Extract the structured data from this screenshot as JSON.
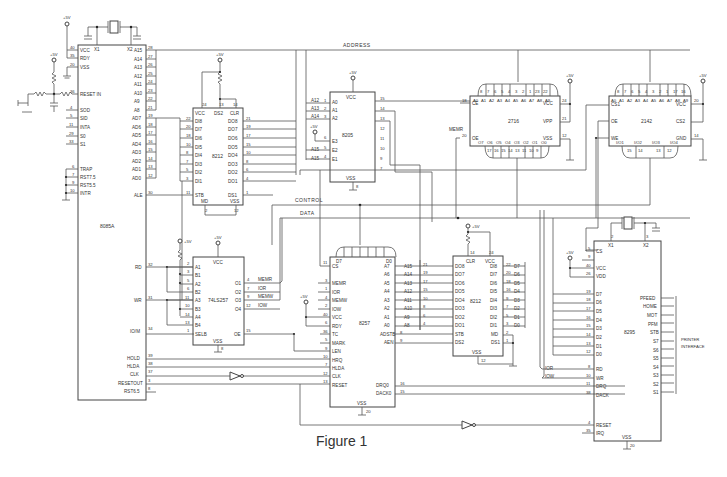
{
  "figure": {
    "caption": "Figure 1",
    "supply_label": "+5V",
    "buses": {
      "address": "ADDRESS",
      "control": "CONTROL",
      "data": "DATA"
    },
    "chips": {
      "cpu": {
        "name": "8085A",
        "left_pins": [
          {
            "num": "40",
            "label": "VCC"
          },
          {
            "num": "35",
            "label": "RDY"
          },
          {
            "num": "20",
            "label": "VSS"
          },
          {
            "num": "36",
            "label": "RESET IN"
          },
          {
            "num": "4",
            "label": "SOD"
          },
          {
            "num": "5",
            "label": "SID"
          },
          {
            "num": "11",
            "label": "INTA"
          },
          {
            "num": "29",
            "label": "S0"
          },
          {
            "num": "33",
            "label": "S1"
          },
          {
            "num": "6",
            "label": "TRAP"
          },
          {
            "num": "7",
            "label": "RST7.5"
          },
          {
            "num": "9",
            "label": "RST5.5"
          },
          {
            "num": "10",
            "label": "INTR"
          }
        ],
        "top_pins": [
          {
            "num": "1",
            "label": "X1"
          },
          {
            "num": "2",
            "label": "X2"
          }
        ],
        "right_pins": [
          {
            "num": "28",
            "label": "A15"
          },
          {
            "num": "27",
            "label": "A14"
          },
          {
            "num": "26",
            "label": "A13"
          },
          {
            "num": "25",
            "label": "A12"
          },
          {
            "num": "24",
            "label": "A11"
          },
          {
            "num": "23",
            "label": "A10"
          },
          {
            "num": "22",
            "label": "A9"
          },
          {
            "num": "21",
            "label": "A8"
          },
          {
            "num": "19",
            "label": "AD7"
          },
          {
            "num": "18",
            "label": "AD6"
          },
          {
            "num": "17",
            "label": "AD5"
          },
          {
            "num": "16",
            "label": "AD4"
          },
          {
            "num": "15",
            "label": "AD3"
          },
          {
            "num": "14",
            "label": "AD2"
          },
          {
            "num": "13",
            "label": "AD1"
          },
          {
            "num": "12",
            "label": "AD0"
          },
          {
            "num": "30",
            "label": "ALE"
          }
        ],
        "lower_pins": [
          {
            "num": "32",
            "label": "RD"
          },
          {
            "num": "31",
            "label": "WR"
          },
          {
            "num": "34",
            "label": "IO/M"
          },
          {
            "num": "39",
            "label": "HOLD"
          },
          {
            "num": "38",
            "label": "HLDA"
          },
          {
            "num": "37",
            "label": "CLK"
          },
          {
            "num": "3",
            "label": "RESETOUT"
          },
          {
            "num": "8",
            "label": "RST6.5"
          }
        ]
      },
      "latch": {
        "name": "8212",
        "top_pins": [
          {
            "num": "24",
            "label": "VCC"
          },
          {
            "num": "13",
            "label": "DS2"
          },
          {
            "num": "14",
            "label": "CLR"
          }
        ],
        "left_pins": [
          {
            "num": "22",
            "label": "DI8"
          },
          {
            "num": "20",
            "label": "DI7"
          },
          {
            "num": "18",
            "label": "DI6"
          },
          {
            "num": "10",
            "label": "DI5"
          },
          {
            "num": "8",
            "label": "DI4"
          },
          {
            "num": "7",
            "label": "DI3"
          },
          {
            "num": "5",
            "label": "DI2"
          },
          {
            "num": "3",
            "label": "DI1"
          },
          {
            "num": "11",
            "label": "STB"
          }
        ],
        "right_pins": [
          {
            "num": "21",
            "label": "DO8"
          },
          {
            "num": "19",
            "label": "DO7"
          },
          {
            "num": "17",
            "label": "DO6"
          },
          {
            "num": "15",
            "label": "DO5"
          },
          {
            "num": "10",
            "label": "DO4"
          },
          {
            "num": "8",
            "label": "DO3"
          },
          {
            "num": "6",
            "label": "DO2"
          },
          {
            "num": "4",
            "label": "DO1"
          },
          {
            "num": "1",
            "label": "DS1"
          }
        ],
        "bottom_pins": [
          {
            "num": "2",
            "label": "MD"
          },
          {
            "num": "12",
            "label": "VSS"
          }
        ]
      },
      "decoder": {
        "name": "8205",
        "top_pin": "VCC",
        "bottom_pin": "VSS",
        "inputs": [
          {
            "net": "A12",
            "num": "1",
            "label": "A0"
          },
          {
            "net": "A13",
            "num": "2",
            "label": "A1"
          },
          {
            "net": "A14",
            "num": "3",
            "label": "A2"
          },
          {
            "net": "+5V",
            "num": "6",
            "label": "E3"
          },
          {
            "net": "A15",
            "num": "5",
            "label": "E2"
          },
          {
            "net": "A15",
            "num": "4",
            "label": "E1"
          }
        ],
        "outputs": [
          "15",
          "14",
          "13",
          "12",
          "11",
          "10",
          "9",
          "7"
        ],
        "bottom_num": "8"
      },
      "eprom": {
        "name": "2716",
        "addr_pins": [
          "A0",
          "A1",
          "A2",
          "A3",
          "A4",
          "A5",
          "A6",
          "A7",
          "A8",
          "A9"
        ],
        "addr_nums": [
          "8",
          "7",
          "6",
          "5",
          "4",
          "3",
          "2",
          "1",
          "23",
          "22"
        ],
        "data_pins": [
          "O7",
          "O6",
          "O5",
          "O4",
          "O3",
          "O2",
          "O1",
          "O0"
        ],
        "data_nums": [
          "17",
          "16",
          "15",
          "14",
          "13",
          "11",
          "10",
          "9"
        ],
        "left_pins": [
          {
            "num": "18",
            "label": "CE"
          },
          {
            "num": "20",
            "label": "OE"
          }
        ],
        "right_pins": [
          {
            "num": "24",
            "label": "VCC"
          },
          {
            "num": "21",
            "label": "VPP"
          },
          {
            "num": "12",
            "label": "VSS"
          }
        ],
        "oe_net": "MEMR"
      },
      "ram": {
        "name": "2142",
        "addr_pins": [
          "A0",
          "A1",
          "A2",
          "A3",
          "A4",
          "A5",
          "A6",
          "A7",
          "A8",
          "A9"
        ],
        "addr_nums": [
          "8",
          "7",
          "6",
          "5",
          "4",
          "3",
          "2",
          "1",
          "17",
          "16"
        ],
        "data_pins": [
          "I/O1",
          "I/O2",
          "I/O3",
          "I/O4"
        ],
        "data_nums": [
          "15",
          "14",
          "13",
          "12"
        ],
        "left_pins": [
          {
            "num": "",
            "label": "CS1"
          },
          {
            "num": "",
            "label": "OE"
          },
          {
            "num": "",
            "label": "WE"
          }
        ],
        "right_pins": [
          {
            "num": "20",
            "label": "VCC"
          },
          {
            "num": "",
            "label": "CS2"
          },
          {
            "num": "14",
            "label": "GND"
          }
        ]
      },
      "mux": {
        "name": "74LS257",
        "top_pin": "VCC",
        "bottom_pin": "VSS",
        "bottom_num": "8",
        "inputs": [
          {
            "num": "2",
            "label": "A1"
          },
          {
            "num": "3",
            "label": "B1"
          },
          {
            "num": "5",
            "label": "A2"
          },
          {
            "num": "6",
            "label": "B2"
          },
          {
            "num": "11",
            "label": "A3"
          },
          {
            "num": "10",
            "label": "B3"
          },
          {
            "num": "14",
            "label": "A4"
          },
          {
            "num": "13",
            "label": "B4"
          },
          {
            "num": "1",
            "label": "SELB"
          }
        ],
        "outputs": [
          {
            "num": "4",
            "label": "O1",
            "net": "MEMR"
          },
          {
            "num": "7",
            "label": "O2",
            "net": "IOR"
          },
          {
            "num": "9",
            "label": "O3",
            "net": "MEMW"
          },
          {
            "num": "12",
            "label": "O4",
            "net": "IOW"
          },
          {
            "num": "15",
            "label": "OE",
            "net": ""
          }
        ]
      },
      "dma": {
        "name": "8257",
        "top_labels": [
          "D7",
          "D0"
        ],
        "left_pins": [
          {
            "num": "11",
            "label": "CS"
          },
          {
            "num": "3",
            "label": "MEMR"
          },
          {
            "num": "1",
            "label": "IOR"
          },
          {
            "num": "4",
            "label": "MEMW"
          },
          {
            "num": "2",
            "label": "IOW"
          },
          {
            "num": "40",
            "label": "VCC"
          },
          {
            "num": "6",
            "label": "RDY"
          },
          {
            "num": "36",
            "label": "TC"
          },
          {
            "num": "5",
            "label": "MARK"
          },
          {
            "num": "9",
            "label": "LEN"
          },
          {
            "num": "10",
            "label": "HRQ"
          },
          {
            "num": "7",
            "label": "HLDA"
          },
          {
            "num": "12",
            "label": "CLK"
          },
          {
            "num": "13",
            "label": "RESET"
          }
        ],
        "right_pins": [
          {
            "label": "A7",
            "net": "A15",
            "num": "21"
          },
          {
            "label": "A6",
            "net": "A14",
            "num": "19"
          },
          {
            "label": "A5",
            "net": "A13",
            "num": "17"
          },
          {
            "label": "A4",
            "net": "A12",
            "num": "15"
          },
          {
            "label": "A3",
            "net": "A11",
            "num": "10"
          },
          {
            "label": "A2",
            "net": "A10",
            "num": "8"
          },
          {
            "label": "A1",
            "net": "A9",
            "num": "6"
          },
          {
            "label": "A0",
            "net": "A8",
            "num": "4"
          },
          {
            "label": "ADSTB",
            "net": "",
            "num": "8"
          },
          {
            "label": "AEN",
            "net": "",
            "num": "9"
          },
          {
            "label": "DRQ0",
            "net": "",
            "num": "16"
          },
          {
            "label": "DACK0",
            "net": "",
            "num": "15"
          }
        ],
        "bottom_pin": "VSS",
        "bottom_num": "20"
      },
      "latch2": {
        "name": "8212",
        "top_pins": [
          {
            "num": "14",
            "label": "CLR"
          },
          {
            "num": "24",
            "label": "VCC"
          }
        ],
        "left_pins": [
          "DO8",
          "DO7",
          "DO6",
          "DO5",
          "DO4",
          "DO3",
          "DO2",
          "DO1",
          "STB",
          "DS2"
        ],
        "right_pins": [
          {
            "label": "DI8",
            "net": "D7",
            "num": "22"
          },
          {
            "label": "DI7",
            "net": "D6",
            "num": "20"
          },
          {
            "label": "DI6",
            "net": "D5",
            "num": "18"
          },
          {
            "label": "DI5",
            "net": "D4",
            "num": "16"
          },
          {
            "label": "DI4",
            "net": "D3",
            "num": "9"
          },
          {
            "label": "DI3",
            "net": "D2",
            "num": "7"
          },
          {
            "label": "DI2",
            "net": "D1",
            "num": "5"
          },
          {
            "label": "DI1",
            "net": "D0",
            "num": "3"
          },
          {
            "label": "MD",
            "net": "",
            "num": "2"
          },
          {
            "label": "DS1",
            "net": "",
            "num": "1"
          }
        ],
        "bottom_pin": "VSS",
        "bottom_num": "12"
      },
      "fdc": {
        "name": "8295",
        "top_pins": [
          {
            "num": "2",
            "label": "X1"
          },
          {
            "num": "3",
            "label": "X2"
          }
        ],
        "left_pins": [
          {
            "num": "5",
            "label": "CS"
          },
          {
            "num": "9",
            "label": ""
          },
          {
            "num": "40",
            "label": "VCC"
          },
          {
            "num": "26",
            "label": "VDD"
          },
          {
            "num": "19",
            "label": "D7"
          },
          {
            "num": "18",
            "label": "D6"
          },
          {
            "num": "17",
            "label": "D5"
          },
          {
            "num": "16",
            "label": "D4"
          },
          {
            "num": "15",
            "label": "D3"
          },
          {
            "num": "14",
            "label": "D2"
          },
          {
            "num": "13",
            "label": "D1"
          },
          {
            "num": "12",
            "label": "D0"
          },
          {
            "num": "8",
            "label": "RD"
          },
          {
            "num": "10",
            "label": "WR"
          },
          {
            "num": "11",
            "label": "DRQ"
          },
          {
            "num": "38",
            "label": "DACK"
          },
          {
            "num": "4",
            "label": "RESET"
          },
          {
            "num": "35",
            "label": "IRQ"
          }
        ],
        "left_nets": [
          "IOR",
          "IOW"
        ],
        "right_pins": [
          "PFEED",
          "HOME",
          "MOT",
          "PFM",
          "STB",
          "S7",
          "S6",
          "S5",
          "S4",
          "S3",
          "S2",
          "S1"
        ],
        "bottom_pin": "VSS",
        "bottom_num": "20",
        "interface_label_1": "PRINTER",
        "interface_label_2": "INTERFACE"
      }
    }
  }
}
